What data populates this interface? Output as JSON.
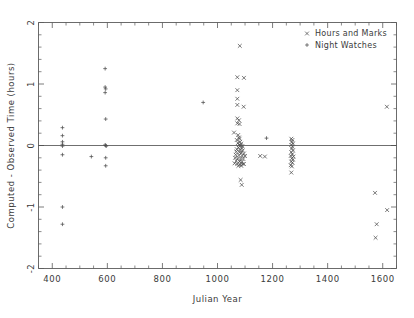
{
  "chart_data": {
    "type": "scatter",
    "title": "",
    "xlabel": "Julian Year",
    "ylabel": "Computed - Observed Time (hours)",
    "xlim": [
      350,
      1650
    ],
    "ylim": [
      -2,
      2
    ],
    "grid": false,
    "legend_position": "top-right",
    "xticks": [
      400,
      600,
      800,
      1000,
      1200,
      1400,
      1600
    ],
    "yticks": [
      2,
      1,
      0,
      -1,
      -2
    ],
    "xtick_labels": [
      "400",
      "600",
      "800",
      "1000",
      "1200",
      "1400",
      "1600"
    ],
    "ytick_labels": [
      "2",
      "1",
      "0",
      "-1",
      "-2"
    ],
    "x_minor_interval": 50,
    "y_minor_interval": 0.2,
    "reference_line_y": 0,
    "series": [
      {
        "name": "Hours and Marks",
        "marker": "x",
        "color": "#4d4d4d",
        "points": [
          [
            1081,
            1.62
          ],
          [
            1072,
            1.11
          ],
          [
            1096,
            1.1
          ],
          [
            1072,
            0.9
          ],
          [
            1072,
            0.76
          ],
          [
            1072,
            0.66
          ],
          [
            1095,
            0.63
          ],
          [
            1072,
            0.44
          ],
          [
            1078,
            0.41
          ],
          [
            1072,
            0.36
          ],
          [
            1080,
            0.35
          ],
          [
            1060,
            0.21
          ],
          [
            1075,
            0.17
          ],
          [
            1078,
            0.13
          ],
          [
            1080,
            0.11
          ],
          [
            1070,
            0.09
          ],
          [
            1082,
            0.06
          ],
          [
            1074,
            0.04
          ],
          [
            1086,
            0.03
          ],
          [
            1078,
            0.01
          ],
          [
            1084,
            0.0
          ],
          [
            1090,
            -0.01
          ],
          [
            1076,
            -0.03
          ],
          [
            1088,
            -0.04
          ],
          [
            1070,
            -0.06
          ],
          [
            1082,
            -0.07
          ],
          [
            1092,
            -0.08
          ],
          [
            1068,
            -0.1
          ],
          [
            1080,
            -0.11
          ],
          [
            1086,
            -0.12
          ],
          [
            1096,
            -0.13
          ],
          [
            1066,
            -0.15
          ],
          [
            1078,
            -0.16
          ],
          [
            1090,
            -0.17
          ],
          [
            1100,
            -0.17
          ],
          [
            1064,
            -0.2
          ],
          [
            1074,
            -0.21
          ],
          [
            1084,
            -0.22
          ],
          [
            1094,
            -0.22
          ],
          [
            1068,
            -0.25
          ],
          [
            1080,
            -0.26
          ],
          [
            1088,
            -0.27
          ],
          [
            1062,
            -0.29
          ],
          [
            1072,
            -0.3
          ],
          [
            1082,
            -0.31
          ],
          [
            1091,
            -0.3
          ],
          [
            1076,
            -0.33
          ],
          [
            1086,
            -0.33
          ],
          [
            1096,
            -0.3
          ],
          [
            1084,
            -0.56
          ],
          [
            1088,
            -0.64
          ],
          [
            1155,
            -0.17
          ],
          [
            1172,
            -0.18
          ],
          [
            1268,
            0.11
          ],
          [
            1272,
            0.09
          ],
          [
            1270,
            0.06
          ],
          [
            1274,
            0.03
          ],
          [
            1268,
            0.01
          ],
          [
            1272,
            -0.02
          ],
          [
            1270,
            -0.05
          ],
          [
            1274,
            -0.08
          ],
          [
            1268,
            -0.11
          ],
          [
            1272,
            -0.14
          ],
          [
            1266,
            -0.17
          ],
          [
            1276,
            -0.18
          ],
          [
            1270,
            -0.21
          ],
          [
            1274,
            -0.23
          ],
          [
            1268,
            -0.26
          ],
          [
            1272,
            -0.28
          ],
          [
            1266,
            -0.32
          ],
          [
            1270,
            -0.34
          ],
          [
            1268,
            -0.44
          ],
          [
            1615,
            0.63
          ],
          [
            1572,
            -0.77
          ],
          [
            1616,
            -1.05
          ],
          [
            1578,
            -1.28
          ],
          [
            1574,
            -1.5
          ]
        ]
      },
      {
        "name": "Night Watches",
        "marker": "plus",
        "color": "#4d4d4d",
        "points": [
          [
            437,
            0.29
          ],
          [
            437,
            0.16
          ],
          [
            437,
            0.06
          ],
          [
            437,
            0.02
          ],
          [
            437,
            -0.01
          ],
          [
            437,
            -0.15
          ],
          [
            437,
            -1.0
          ],
          [
            437,
            -1.28
          ],
          [
            542,
            -0.18
          ],
          [
            592,
            1.25
          ],
          [
            592,
            0.95
          ],
          [
            594,
            0.92
          ],
          [
            592,
            0.86
          ],
          [
            594,
            0.43
          ],
          [
            594,
            0.0
          ],
          [
            592,
            0.01
          ],
          [
            596,
            -0.01
          ],
          [
            594,
            -0.2
          ],
          [
            594,
            -0.33
          ],
          [
            948,
            0.7
          ],
          [
            1178,
            0.12
          ]
        ]
      }
    ]
  },
  "legend": {
    "entries": [
      {
        "label": "Hours and Marks",
        "marker": "x"
      },
      {
        "label": "Night Watches",
        "marker": "plus"
      }
    ]
  }
}
